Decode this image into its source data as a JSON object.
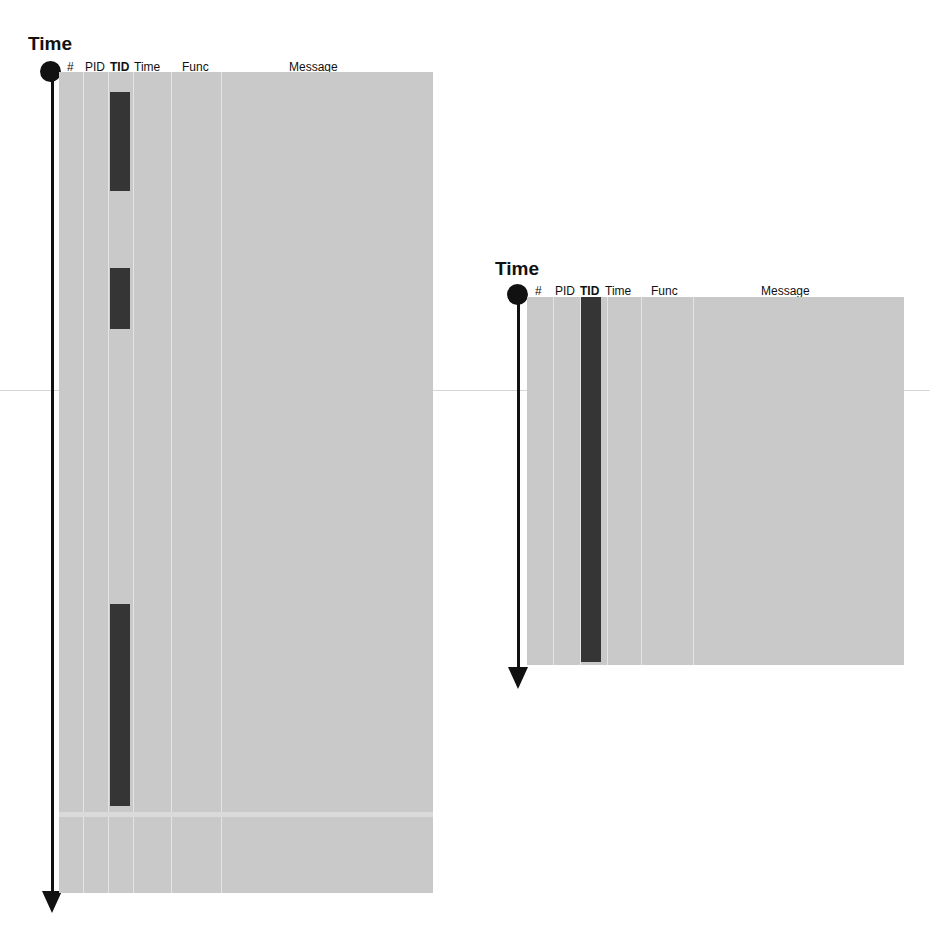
{
  "diagrams": [
    {
      "id": "left",
      "axis_label": "Time",
      "columns": [
        "#",
        "PID",
        "TID",
        "Time",
        "Func",
        "Message"
      ],
      "highlighted_column": "TID",
      "tid_blocks": [
        {
          "start_pct": 2.4,
          "end_pct": 14.4
        },
        {
          "start_pct": 24.2,
          "end_pct": 31.7
        },
        {
          "start_pct": 64.8,
          "end_pct": 89.4
        }
      ]
    },
    {
      "id": "right",
      "axis_label": "Time",
      "columns": [
        "#",
        "PID",
        "TID",
        "Time",
        "Func",
        "Message"
      ],
      "highlighted_column": "TID",
      "tid_blocks": [
        {
          "start_pct": 0,
          "end_pct": 99
        }
      ]
    }
  ],
  "colors": {
    "panel": "#c9c9c9",
    "tid_block": "#353535",
    "axis": "#111111",
    "divider": "#e4e4e4"
  }
}
